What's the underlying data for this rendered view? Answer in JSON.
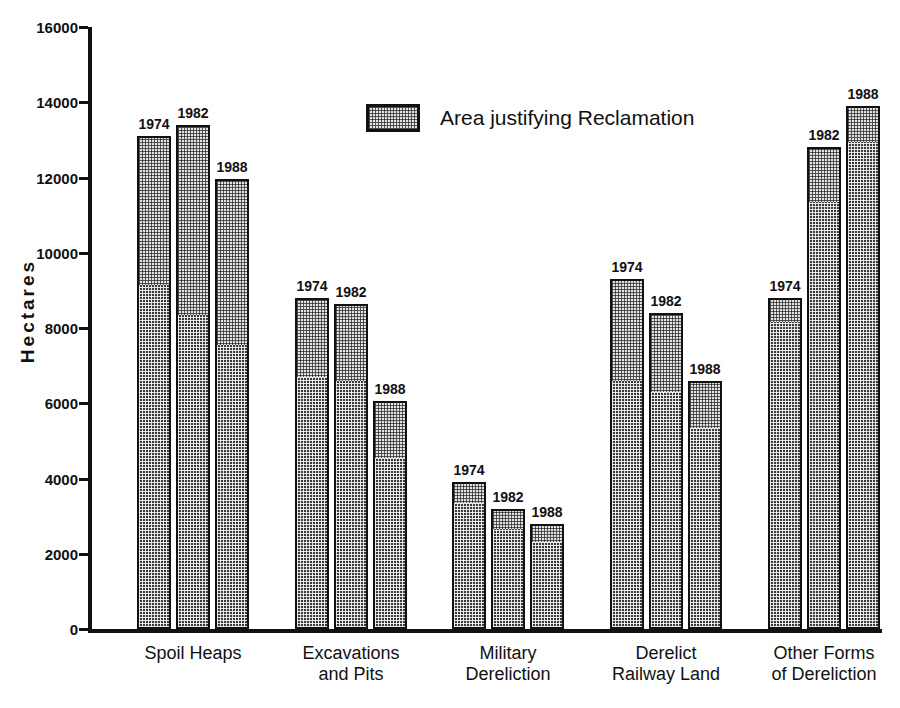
{
  "chart_data": {
    "type": "bar",
    "title": "",
    "subtitle": "",
    "xlabel": "",
    "ylabel": "Hectares",
    "ylim": [
      0,
      16000
    ],
    "y_ticks": [
      0,
      2000,
      4000,
      6000,
      8000,
      10000,
      12000,
      14000,
      16000
    ],
    "y_tick_labels": [
      "0",
      "2000",
      "4000",
      "6000",
      "8000",
      "10000",
      "12000",
      "14000",
      "16000"
    ],
    "grid": false,
    "stacked": true,
    "legend": {
      "position": "top-center",
      "entries": [
        {
          "label": "Area justifying Reclamation",
          "swatch": "light-checker"
        }
      ]
    },
    "categories": [
      "Spoil Heaps",
      "Excavations\nand Pits",
      "Military\nDereliction",
      "Derelict\nRailway Land",
      "Other Forms\nof Dereliction"
    ],
    "bar_labels": [
      "1974",
      "1982",
      "1988"
    ],
    "series": [
      {
        "name": "Other derelict land",
        "swatch": "dark-checker",
        "values": [
          [
            9100,
            8300,
            7500
          ],
          [
            6650,
            6550,
            4500
          ],
          [
            3300,
            2600,
            2250
          ],
          [
            6550,
            6250,
            5300
          ],
          [
            8100,
            11300,
            12900
          ]
        ]
      },
      {
        "name": "Area justifying Reclamation",
        "swatch": "light-checker",
        "values": [
          [
            4000,
            5100,
            4450
          ],
          [
            2150,
            2100,
            1550
          ],
          [
            600,
            600,
            550
          ],
          [
            2750,
            2150,
            1300
          ],
          [
            700,
            1500,
            1000
          ]
        ]
      }
    ],
    "totals": [
      [
        13100,
        13400,
        11950
      ],
      [
        8800,
        8650,
        6050
      ],
      [
        3900,
        3200,
        2800
      ],
      [
        9300,
        8400,
        6600
      ],
      [
        8800,
        12800,
        13900
      ]
    ],
    "colors": {
      "dark": "#3a3a3a",
      "light": "#e2e2e2",
      "outline": "#111111",
      "background": "#ffffff"
    }
  }
}
